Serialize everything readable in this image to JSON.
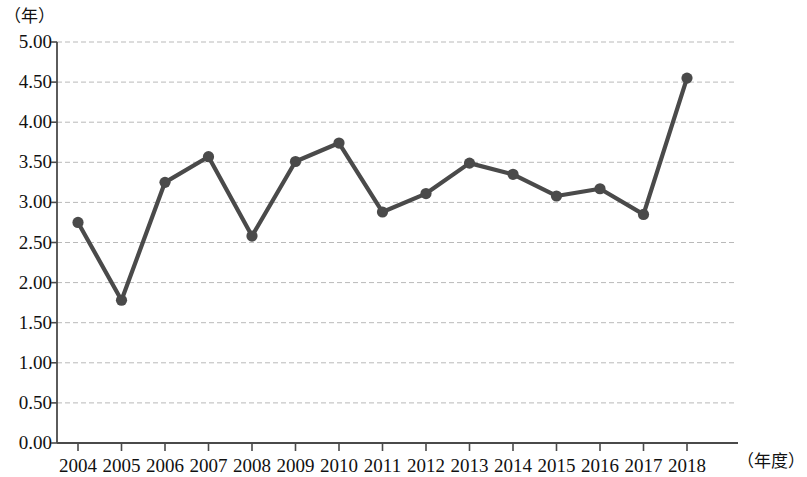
{
  "chart_data": {
    "type": "line",
    "title": "",
    "subtitle": "",
    "xlabel": "（年度）",
    "ylabel": "（年）",
    "categories": [
      "2004",
      "2005",
      "2006",
      "2007",
      "2008",
      "2009",
      "2010",
      "2011",
      "2012",
      "2013",
      "2014",
      "2015",
      "2016",
      "2017",
      "2018"
    ],
    "values": [
      2.75,
      1.78,
      3.25,
      3.57,
      2.58,
      3.51,
      3.74,
      2.88,
      3.11,
      3.49,
      3.35,
      3.08,
      3.17,
      2.85,
      4.55
    ],
    "series": [
      {
        "name": "",
        "values": [
          2.75,
          1.78,
          3.25,
          3.57,
          2.58,
          3.51,
          3.74,
          2.88,
          3.11,
          3.49,
          3.35,
          3.08,
          3.17,
          2.85,
          4.55
        ]
      }
    ],
    "ylim": [
      0.0,
      5.0
    ],
    "ytick_labels": [
      "5.00",
      "4.50",
      "4.00",
      "3.50",
      "3.00",
      "2.50",
      "2.00",
      "1.50",
      "1.00",
      "0.50",
      "0.00"
    ],
    "ytick_values": [
      5.0,
      4.5,
      4.0,
      3.5,
      3.0,
      2.5,
      2.0,
      1.5,
      1.0,
      0.5,
      0.0
    ],
    "grid": true,
    "grid_style": "dashed",
    "legend": null,
    "legend_position": "none",
    "marker": "circle",
    "colors": {
      "line": "#4a4a4a",
      "marker": "#4a4a4a",
      "grid": "#b9b9b9",
      "axis": "#4a4a4a",
      "text": "#111111",
      "background": "#ffffff"
    }
  }
}
